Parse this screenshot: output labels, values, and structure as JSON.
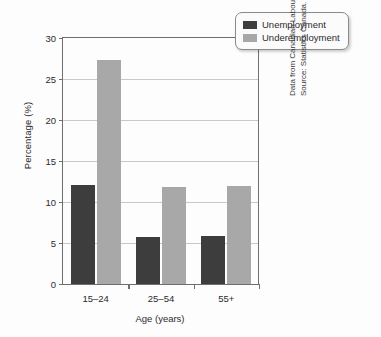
{
  "chart_data": {
    "type": "bar",
    "title": "",
    "categories": [
      "15–24",
      "25–54",
      "55+"
    ],
    "series": [
      {
        "name": "Unemployment",
        "color": "#3d3d3d",
        "values": [
          12.1,
          5.7,
          5.9
        ]
      },
      {
        "name": "Underemployment",
        "color": "#a8a8a8",
        "values": [
          27.3,
          11.8,
          12.0
        ]
      }
    ],
    "xlabel": "Age (years)",
    "ylabel": "Percentage (%)",
    "ylim": [
      0,
      30
    ],
    "yticks": [
      0,
      5,
      10,
      15,
      20,
      25,
      30
    ],
    "ytick_labels": [
      "0",
      "5",
      "10",
      "15",
      "20",
      "25",
      "30"
    ],
    "grid": true,
    "legend_position": "top-right"
  },
  "legend": {
    "items": [
      {
        "label": "Unemployment",
        "color": "#3d3d3d"
      },
      {
        "label": "Underemployment",
        "color": "#a8a8a8"
      }
    ]
  },
  "source_note": {
    "line1": "Data from Canadian Labour Congress (2014).",
    "line2": "Source: Statistics Canada."
  },
  "colors": {
    "unemployment": "#3d3d3d",
    "underemployment": "#a8a8a8",
    "axis": "#6e6e6e",
    "gridline": "#c9c9c9",
    "text": "#2d2a2b"
  }
}
